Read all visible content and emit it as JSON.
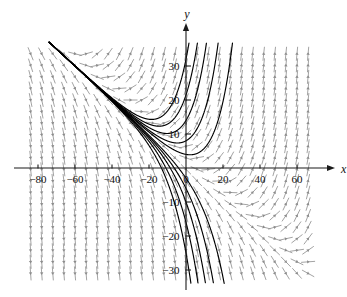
{
  "figure": {
    "type": "direction-field",
    "background": "#ffffff",
    "axis_color": "#1a1a1a",
    "field_color": "#8c8c8c",
    "curve_color": "#000000"
  },
  "axes": {
    "x_label": "x",
    "y_label": "y",
    "x_ticks": [
      {
        "value": -80,
        "label": "−80"
      },
      {
        "value": -60,
        "label": "−60"
      },
      {
        "value": -40,
        "label": "−40"
      },
      {
        "value": -20,
        "label": "−20"
      },
      {
        "value": 0,
        "label": "0"
      },
      {
        "value": 20,
        "label": "20"
      },
      {
        "value": 40,
        "label": "40"
      },
      {
        "value": 60,
        "label": "60"
      }
    ],
    "y_ticks": [
      {
        "value": 30,
        "label": "30"
      },
      {
        "value": 20,
        "label": "20"
      },
      {
        "value": 10,
        "label": "10"
      },
      {
        "value": -10,
        "label": "−10"
      },
      {
        "value": -20,
        "label": "−20"
      },
      {
        "value": -30,
        "label": "−30"
      }
    ],
    "x_minor_step": 5,
    "y_minor_step": 5,
    "xlim": [
      -88,
      70
    ],
    "ylim": [
      -33,
      36
    ]
  },
  "chart_data": {
    "type": "line",
    "title": "",
    "xlabel": "x",
    "ylabel": "y",
    "xlim": [
      -88,
      70
    ],
    "ylim": [
      -33,
      36
    ],
    "grid": false,
    "legend": "none",
    "xticks": [
      -80,
      -60,
      -40,
      -20,
      0,
      20,
      40,
      60
    ],
    "yticks": [
      -30,
      -20,
      -10,
      10,
      20,
      30
    ],
    "xticklabels": [
      "−80",
      "−60",
      "−40",
      "−20",
      "0",
      "20",
      "40",
      "60"
    ],
    "yticklabels": [
      "−30",
      "−20",
      "−10",
      "10",
      "20",
      "30"
    ],
    "asymptote": {
      "slope": -0.5,
      "intercept": 0,
      "equation": "y = -x/2"
    },
    "field": {
      "x_start": -84,
      "x_step": 6,
      "x_count": 26,
      "y_start": -31,
      "y_step": 3.4,
      "y_count": 20,
      "rule": "slope = (y + 0.5*x) mapped; arrows vertical far from asymptote, horizontal near it"
    },
    "series": [
      {
        "name": "curve-1",
        "y0": 32.0,
        "note": "outermost upper-left solution curve"
      },
      {
        "name": "curve-2",
        "y0": 21.5,
        "note": "upper-left solution curve"
      },
      {
        "name": "curve-3",
        "y0": 14.0,
        "note": "upper-left solution curve"
      },
      {
        "name": "curve-4",
        "y0": 8.0,
        "note": "upper-left solution curve"
      },
      {
        "name": "curve-5",
        "y0": 4.0,
        "note": "innermost upper-left solution curve"
      },
      {
        "name": "curve-6",
        "y0": -3.0,
        "note": "innermost lower-right solution curve"
      },
      {
        "name": "curve-7",
        "y0": -6.0,
        "note": "lower-right solution curve"
      },
      {
        "name": "curve-8",
        "y0": -10.0,
        "note": "lower-right solution curve"
      },
      {
        "name": "curve-9",
        "y0": -16.0,
        "note": "lower-right solution curve"
      },
      {
        "name": "curve-10",
        "y0": -25.0,
        "note": "outermost lower-right solution curve"
      }
    ]
  }
}
